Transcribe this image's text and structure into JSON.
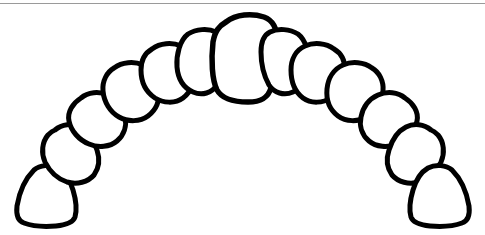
{
  "figure": {
    "type": "line-drawing",
    "background_color": "#ffffff",
    "stroke_color": "#000000",
    "fill_color": "#ffffff",
    "stroke_width": 5,
    "canvas": {
      "width": 485,
      "height": 235
    }
  },
  "rule": {
    "label": "top-horizontal-rule",
    "color": "#9a9a9a",
    "y": 3,
    "thickness": 1
  },
  "arch": {
    "tooth_count": 13,
    "teeth": [
      {
        "index": 1,
        "name": "left-second-molar",
        "side": "left",
        "cx": 52,
        "cy": 196,
        "rotation": -62
      },
      {
        "index": 2,
        "name": "left-first-molar",
        "side": "left",
        "cx": 71,
        "cy": 151,
        "rotation": -52
      },
      {
        "index": 3,
        "name": "left-second-premolar",
        "side": "left",
        "cx": 97,
        "cy": 119,
        "rotation": -42
      },
      {
        "index": 4,
        "name": "left-first-premolar",
        "side": "left",
        "cx": 130,
        "cy": 89,
        "rotation": -31
      },
      {
        "index": 5,
        "name": "left-canine",
        "side": "left",
        "cx": 165,
        "cy": 66,
        "rotation": -20
      },
      {
        "index": 6,
        "name": "left-lateral-incisor",
        "side": "left",
        "cx": 198,
        "cy": 52,
        "rotation": -10
      },
      {
        "index": 7,
        "name": "central-incisor",
        "side": "center",
        "cx": 243,
        "cy": 56,
        "rotation": 0
      },
      {
        "index": 8,
        "name": "right-lateral-incisor",
        "side": "right",
        "cx": 289,
        "cy": 52,
        "rotation": 10
      },
      {
        "index": 9,
        "name": "right-canine",
        "side": "right",
        "cx": 322,
        "cy": 66,
        "rotation": 20
      },
      {
        "index": 10,
        "name": "right-first-premolar",
        "side": "right",
        "cx": 356,
        "cy": 89,
        "rotation": 31
      },
      {
        "index": 11,
        "name": "right-second-premolar",
        "side": "right",
        "cx": 389,
        "cy": 119,
        "rotation": 42
      },
      {
        "index": 12,
        "name": "right-first-molar",
        "side": "right",
        "cx": 415,
        "cy": 151,
        "rotation": 52
      },
      {
        "index": 13,
        "name": "right-second-molar",
        "side": "right",
        "cx": 434,
        "cy": 196,
        "rotation": 62
      }
    ]
  }
}
